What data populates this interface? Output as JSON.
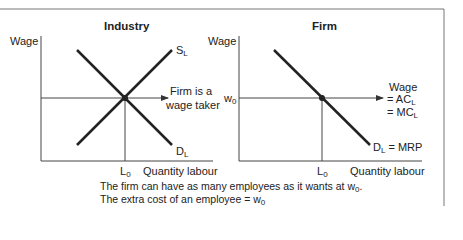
{
  "industry": {
    "title": "Industry",
    "y_label": "Wage",
    "supply_label": "S",
    "supply_sub": "L",
    "demand_label": "D",
    "demand_sub": "L",
    "x_mark": "L",
    "x_mark_sub": "0",
    "x_label": "Quantity labour",
    "arrow_text_1": "Firm is a",
    "arrow_text_2": "wage taker"
  },
  "firm": {
    "title": "Firm",
    "y_label": "Wage",
    "w_mark": "w",
    "w_mark_sub": "0",
    "wage_line_1": "Wage",
    "wage_line_2": "= AC",
    "wage_line_2_sub": "L",
    "wage_line_3": "= MC",
    "wage_line_3_sub": "L",
    "demand_label": "D",
    "demand_sub": "L",
    "demand_suffix": " = MRP",
    "x_mark": "L",
    "x_mark_sub": "0",
    "x_label": "Quantity labour"
  },
  "caption": {
    "line1": "The firm can have as many employees as it wants at w",
    "line1_sub": "0",
    "line1_end": ".",
    "line2": "The extra cost of an employee = w",
    "line2_sub": "0"
  }
}
